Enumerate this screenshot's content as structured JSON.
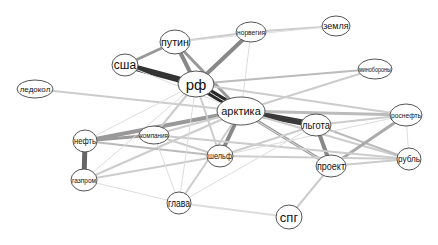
{
  "diagram": {
    "type": "word co-occurrence network",
    "nodes": [
      {
        "id": "rf",
        "label": "рф",
        "x": 196,
        "y": 84,
        "rx": 18,
        "ry": 13,
        "font": 15
      },
      {
        "id": "arktika",
        "label": "арктика",
        "x": 241,
        "y": 111,
        "rx": 24,
        "ry": 14,
        "font": 11
      },
      {
        "id": "ssha",
        "label": "сша",
        "x": 125,
        "y": 65,
        "rx": 13,
        "ry": 11,
        "font": 12
      },
      {
        "id": "putin",
        "label": "путин",
        "x": 175,
        "y": 42,
        "rx": 15,
        "ry": 12,
        "font": 11
      },
      {
        "id": "norvegia",
        "label": "норвегия",
        "x": 251,
        "y": 32,
        "rx": 15,
        "ry": 10,
        "font": 8
      },
      {
        "id": "zemlya",
        "label": "земля",
        "x": 336,
        "y": 26,
        "rx": 14,
        "ry": 10,
        "font": 9
      },
      {
        "id": "minoborony",
        "label": "минобороны",
        "x": 375,
        "y": 69,
        "rx": 17,
        "ry": 10,
        "font": 7
      },
      {
        "id": "ledokol",
        "label": "ледокол",
        "x": 35,
        "y": 89,
        "rx": 18,
        "ry": 9,
        "font": 8
      },
      {
        "id": "rosneft",
        "label": "роснефть",
        "x": 406,
        "y": 115,
        "rx": 16,
        "ry": 11,
        "font": 8
      },
      {
        "id": "lgota",
        "label": "льгота",
        "x": 316,
        "y": 125,
        "rx": 15,
        "ry": 11,
        "font": 10
      },
      {
        "id": "neft",
        "label": "нефть",
        "x": 85,
        "y": 141,
        "rx": 12,
        "ry": 11,
        "font": 9
      },
      {
        "id": "kompania",
        "label": "компания",
        "x": 154,
        "y": 135,
        "rx": 15,
        "ry": 9,
        "font": 7
      },
      {
        "id": "shelf",
        "label": "шельф",
        "x": 220,
        "y": 156,
        "rx": 13,
        "ry": 11,
        "font": 9
      },
      {
        "id": "proekt",
        "label": "проект",
        "x": 331,
        "y": 166,
        "rx": 15,
        "ry": 11,
        "font": 10
      },
      {
        "id": "rubl",
        "label": "рубль",
        "x": 409,
        "y": 159,
        "rx": 12,
        "ry": 11,
        "font": 9
      },
      {
        "id": "gazprom",
        "label": "газпром",
        "x": 84,
        "y": 180,
        "rx": 13,
        "ry": 11,
        "font": 8
      },
      {
        "id": "glava",
        "label": "глава",
        "x": 179,
        "y": 203,
        "rx": 12,
        "ry": 11,
        "font": 10
      },
      {
        "id": "spg",
        "label": "спг",
        "x": 289,
        "y": 217,
        "rx": 13,
        "ry": 12,
        "font": 13
      }
    ],
    "edges": [
      {
        "s": "ssha",
        "t": "rf",
        "w": 6,
        "c": "#333333"
      },
      {
        "s": "rf",
        "t": "arktika",
        "w": 7,
        "c": "#2a2a2a"
      },
      {
        "s": "arktika",
        "t": "lgota",
        "w": 6,
        "c": "#3a3a3a"
      },
      {
        "s": "putin",
        "t": "rf",
        "w": 4,
        "c": "#888888"
      },
      {
        "s": "putin",
        "t": "arktika",
        "w": 3,
        "c": "#999999"
      },
      {
        "s": "ssha",
        "t": "putin",
        "w": 3,
        "c": "#999999"
      },
      {
        "s": "rf",
        "t": "norvegia",
        "w": 4,
        "c": "#888888"
      },
      {
        "s": "putin",
        "t": "norvegia",
        "w": 2,
        "c": "#cccccc"
      },
      {
        "s": "norvegia",
        "t": "zemlya",
        "w": 2,
        "c": "#cccccc"
      },
      {
        "s": "norvegia",
        "t": "arktika",
        "w": 1,
        "c": "#dddddd"
      },
      {
        "s": "putin",
        "t": "zemlya",
        "w": 1,
        "c": "#dddddd"
      },
      {
        "s": "rf",
        "t": "minoborony",
        "w": 2,
        "c": "#bbbbbb"
      },
      {
        "s": "arktika",
        "t": "minoborony",
        "w": 2,
        "c": "#cccccc"
      },
      {
        "s": "ledokol",
        "t": "arktika",
        "w": 2,
        "c": "#cccccc"
      },
      {
        "s": "arktika",
        "t": "rosneft",
        "w": 3,
        "c": "#bbbbbb"
      },
      {
        "s": "arktika",
        "t": "proekt",
        "w": 3,
        "c": "#999999"
      },
      {
        "s": "arktika",
        "t": "shelf",
        "w": 4,
        "c": "#888888"
      },
      {
        "s": "arktika",
        "t": "neft",
        "w": 4,
        "c": "#999999"
      },
      {
        "s": "arktika",
        "t": "kompania",
        "w": 2,
        "c": "#cccccc"
      },
      {
        "s": "arktika",
        "t": "rubl",
        "w": 2,
        "c": "#cccccc"
      },
      {
        "s": "arktika",
        "t": "glava",
        "w": 2,
        "c": "#cccccc"
      },
      {
        "s": "arktika",
        "t": "gazprom",
        "w": 2,
        "c": "#cccccc"
      },
      {
        "s": "lgota",
        "t": "proekt",
        "w": 4,
        "c": "#888888"
      },
      {
        "s": "lgota",
        "t": "rosneft",
        "w": 2,
        "c": "#cccccc"
      },
      {
        "s": "lgota",
        "t": "rubl",
        "w": 2,
        "c": "#bbbbbb"
      },
      {
        "s": "proekt",
        "t": "rosneft",
        "w": 3,
        "c": "#aaaaaa"
      },
      {
        "s": "proekt",
        "t": "rubl",
        "w": 2,
        "c": "#cccccc"
      },
      {
        "s": "rosneft",
        "t": "rubl",
        "w": 1,
        "c": "#dddddd"
      },
      {
        "s": "proekt",
        "t": "spg",
        "w": 2,
        "c": "#cccccc"
      },
      {
        "s": "glava",
        "t": "spg",
        "w": 2,
        "c": "#dddddd"
      },
      {
        "s": "neft",
        "t": "gazprom",
        "w": 5,
        "c": "#666666"
      },
      {
        "s": "neft",
        "t": "kompania",
        "w": 3,
        "c": "#999999"
      },
      {
        "s": "neft",
        "t": "shelf",
        "w": 2,
        "c": "#bbbbbb"
      },
      {
        "s": "gazprom",
        "t": "shelf",
        "w": 2,
        "c": "#cccccc"
      },
      {
        "s": "gazprom",
        "t": "glava",
        "w": 1,
        "c": "#dddddd"
      },
      {
        "s": "gazprom",
        "t": "rf",
        "w": 1,
        "c": "#dddddd"
      },
      {
        "s": "kompania",
        "t": "shelf",
        "w": 2,
        "c": "#cccccc"
      },
      {
        "s": "kompania",
        "t": "rubl",
        "w": 2,
        "c": "#cccccc"
      },
      {
        "s": "kompania",
        "t": "glava",
        "w": 1,
        "c": "#dddddd"
      },
      {
        "s": "shelf",
        "t": "rubl",
        "w": 2,
        "c": "#cccccc"
      },
      {
        "s": "shelf",
        "t": "rosneft",
        "w": 1,
        "c": "#dddddd"
      },
      {
        "s": "shelf",
        "t": "lgota",
        "w": 2,
        "c": "#cccccc"
      },
      {
        "s": "glava",
        "t": "lgota",
        "w": 1,
        "c": "#dddddd"
      },
      {
        "s": "rf",
        "t": "glava",
        "w": 1,
        "c": "#dddddd"
      },
      {
        "s": "rf",
        "t": "shelf",
        "w": 2,
        "c": "#cccccc"
      },
      {
        "s": "rf",
        "t": "kompania",
        "w": 2,
        "c": "#cccccc"
      },
      {
        "s": "rf",
        "t": "rosneft",
        "w": 2,
        "c": "#cccccc"
      },
      {
        "s": "rf",
        "t": "proekt",
        "w": 1,
        "c": "#dddddd"
      },
      {
        "s": "ssha",
        "t": "arktika",
        "w": 1,
        "c": "#dddddd"
      },
      {
        "s": "neft",
        "t": "rf",
        "w": 1,
        "c": "#dddddd"
      }
    ]
  }
}
